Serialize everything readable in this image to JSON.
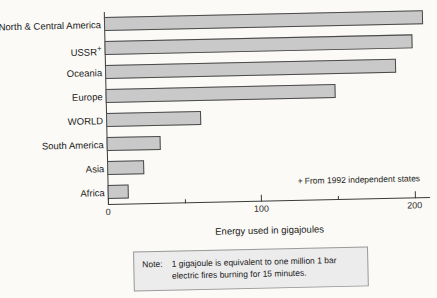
{
  "chart_data": {
    "type": "bar",
    "orientation": "horizontal",
    "title": "",
    "xlabel": "Energy used in gigajoules",
    "ylabel": "",
    "xlim": [
      0,
      210
    ],
    "grid": false,
    "legend": null,
    "categories": [
      "North & Central America",
      "USSR",
      "Oceania",
      "Europe",
      "WORLD",
      "South America",
      "Asia",
      "Africa"
    ],
    "values": [
      208,
      201,
      190,
      150,
      62,
      35,
      24,
      14
    ],
    "tick_labels": [
      "0",
      "100",
      "200"
    ],
    "tick_values": [
      0,
      100,
      200
    ],
    "minor_tick_values": [
      50,
      150
    ],
    "bar_color": "#c9c9c9",
    "bar_border_color": "#4a4a4a"
  },
  "annotations": {
    "ussr_marker": "+",
    "footnote_marker": "+",
    "footnote_text": "From 1992 independent states"
  },
  "note": {
    "label": "Note:",
    "text": "1 gigajoule is equivalent to one million 1 bar electric fires burning for 15 minutes."
  }
}
